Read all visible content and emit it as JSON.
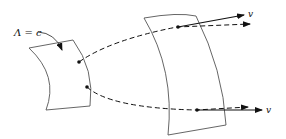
{
  "diagram": {
    "surface_label": "Λ = c",
    "vector_label_top": "v",
    "vector_label_bottom": "v"
  }
}
